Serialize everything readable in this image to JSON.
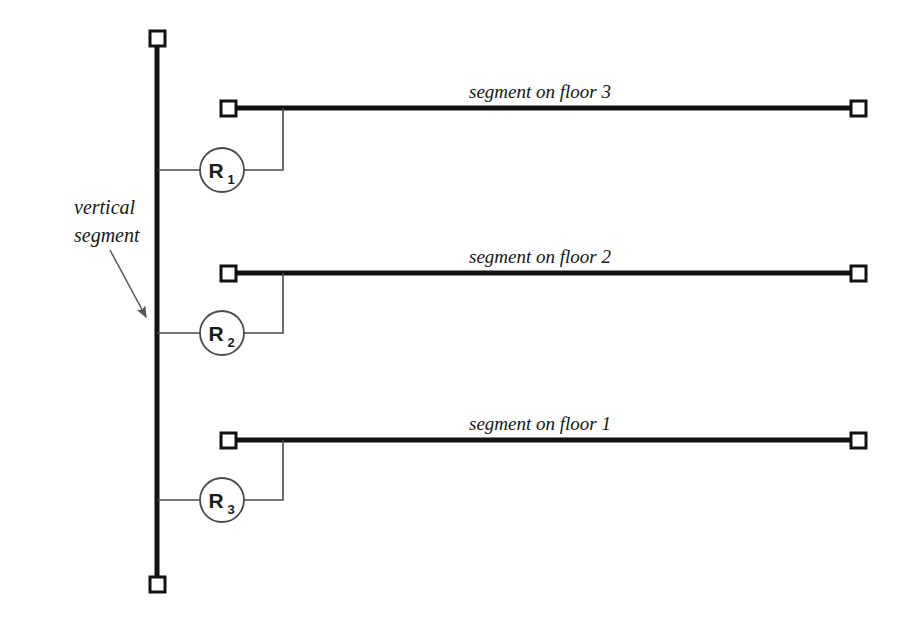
{
  "diagram": {
    "background_color": "#ffffff",
    "line_color": "#111111",
    "thin_line_color": "#4a4a4a",
    "terminator_fill": "#ffffff",
    "vertical_segment": {
      "label_line1": "vertical",
      "label_line2": "segment",
      "x": 157,
      "y_top": 38,
      "y_bottom": 585,
      "thickness": 5
    },
    "floor_segments": [
      {
        "label": "segment on floor 3",
        "y": 108,
        "x_left": 228,
        "x_right": 858,
        "riser_x": 283,
        "label_x": 540,
        "label_y": 98
      },
      {
        "label": "segment on floor 2",
        "y": 273,
        "x_left": 228,
        "x_right": 858,
        "riser_x": 283,
        "label_x": 540,
        "label_y": 263
      },
      {
        "label": "segment on floor 1",
        "y": 440,
        "x_left": 228,
        "x_right": 858,
        "riser_x": 283,
        "label_x": 540,
        "label_y": 430
      }
    ],
    "routers": [
      {
        "name": "R",
        "subscript": "1",
        "cx": 222,
        "cy": 170,
        "r": 22
      },
      {
        "name": "R",
        "subscript": "2",
        "cx": 222,
        "cy": 333,
        "r": 22
      },
      {
        "name": "R",
        "subscript": "3",
        "cx": 222,
        "cy": 500,
        "r": 22
      }
    ],
    "callout": {
      "text_line1": "vertical",
      "text_line2": "segment",
      "text_x": 74,
      "text_y1": 214,
      "text_y2": 242,
      "arrow_start_x": 110,
      "arrow_start_y": 250,
      "arrow_end_x": 149,
      "arrow_end_y": 321
    }
  }
}
